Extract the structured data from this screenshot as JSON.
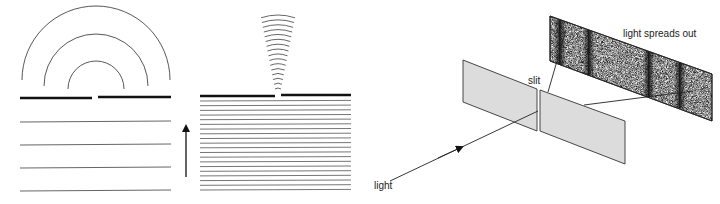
{
  "figure": {
    "panel_left": {
      "description": "wavelength comparable to slit width - waves spread out as semicircles",
      "wavefront_count_incoming": 4,
      "arc_count_outgoing": 3,
      "arrow": "up"
    },
    "panel_middle": {
      "description": "wavelength much smaller than slit width - narrow cone of arcs",
      "wavefront_count_incoming": 20,
      "arc_count_outgoing": 16,
      "arrow": "up"
    },
    "panel_right": {
      "labels": {
        "slit": "slit",
        "light": "light",
        "screen": "light spreads out"
      },
      "colors": {
        "plate_fill": "#dcdcdc",
        "fringe": "#111111"
      },
      "fringe_count": 4
    }
  }
}
